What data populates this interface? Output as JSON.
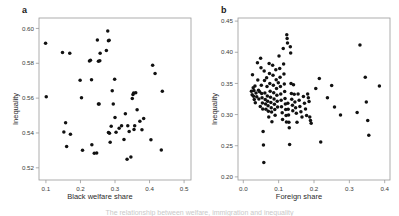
{
  "figure": {
    "background": "#ffffff",
    "marker_color": "#111111",
    "frame_color": "#9a9a9a",
    "caption": "The relationship between welfare, immigration and inequality"
  },
  "panels": [
    {
      "letter": "a",
      "chart_data": {
        "type": "scatter",
        "title": "",
        "xlabel": "Black welfare share",
        "ylabel": "Inequality",
        "xlim": [
          0.08,
          0.52
        ],
        "ylim": [
          0.513,
          0.606
        ],
        "xticks": [
          "0.1",
          "0.2",
          "0.3",
          "0.4",
          "0.5"
        ],
        "xtick_values": [
          0.1,
          0.2,
          0.3,
          0.4,
          0.5
        ],
        "yticks": [
          "0.52",
          "0.54",
          "0.56",
          "0.58",
          "0.60"
        ],
        "ytick_values": [
          0.52,
          0.54,
          0.56,
          0.58,
          0.6
        ],
        "grid": false,
        "legend": "none",
        "n_points": 59,
        "points": [
          [
            0.099,
            0.5915
          ],
          [
            0.101,
            0.5608
          ],
          [
            0.148,
            0.5862
          ],
          [
            0.152,
            0.5405
          ],
          [
            0.157,
            0.5459
          ],
          [
            0.16,
            0.5322
          ],
          [
            0.169,
            0.5858
          ],
          [
            0.171,
            0.5392
          ],
          [
            0.199,
            0.5703
          ],
          [
            0.203,
            0.5602
          ],
          [
            0.206,
            0.5301
          ],
          [
            0.226,
            0.5813
          ],
          [
            0.229,
            0.5818
          ],
          [
            0.232,
            0.5705
          ],
          [
            0.233,
            0.5332
          ],
          [
            0.24,
            0.5284
          ],
          [
            0.247,
            0.5285
          ],
          [
            0.249,
            0.5933
          ],
          [
            0.252,
            0.5812
          ],
          [
            0.252,
            0.5566
          ],
          [
            0.254,
            0.5566
          ],
          [
            0.256,
            0.5814
          ],
          [
            0.257,
            0.5858
          ],
          [
            0.275,
            0.5873
          ],
          [
            0.279,
            0.5985
          ],
          [
            0.281,
            0.593
          ],
          [
            0.281,
            0.5402
          ],
          [
            0.283,
            0.5932
          ],
          [
            0.284,
            0.5399
          ],
          [
            0.286,
            0.5346
          ],
          [
            0.289,
            0.5438
          ],
          [
            0.292,
            0.5643
          ],
          [
            0.295,
            0.5567
          ],
          [
            0.299,
            0.5709
          ],
          [
            0.3,
            0.5489
          ],
          [
            0.303,
            0.5404
          ],
          [
            0.312,
            0.5427
          ],
          [
            0.319,
            0.5441
          ],
          [
            0.326,
            0.5362
          ],
          [
            0.33,
            0.5511
          ],
          [
            0.335,
            0.5249
          ],
          [
            0.337,
            0.5441
          ],
          [
            0.341,
            0.5408
          ],
          [
            0.346,
            0.5262
          ],
          [
            0.35,
            0.5598
          ],
          [
            0.352,
            0.5621
          ],
          [
            0.354,
            0.5629
          ],
          [
            0.355,
            0.542
          ],
          [
            0.357,
            0.5442
          ],
          [
            0.36,
            0.5631
          ],
          [
            0.364,
            0.5534
          ],
          [
            0.372,
            0.5467
          ],
          [
            0.378,
            0.5418
          ],
          [
            0.383,
            0.5483
          ],
          [
            0.404,
            0.5361
          ],
          [
            0.409,
            0.5789
          ],
          [
            0.416,
            0.5742
          ],
          [
            0.434,
            0.5302
          ],
          [
            0.437,
            0.5639
          ]
        ]
      }
    },
    {
      "letter": "b",
      "chart_data": {
        "type": "scatter",
        "title": "",
        "xlabel": "Foreign share",
        "ylabel": "Inequality",
        "xlim": [
          -0.015,
          0.415
        ],
        "ylim": [
          0.195,
          0.455
        ],
        "xticks": [
          "0.0",
          "0.1",
          "0.2",
          "0.3",
          "0.4"
        ],
        "xtick_values": [
          0.0,
          0.1,
          0.2,
          0.3,
          0.4
        ],
        "yticks": [
          "0.20",
          "0.25",
          "0.30",
          "0.35",
          "0.40",
          "0.45"
        ],
        "ytick_values": [
          0.2,
          0.25,
          0.3,
          0.35,
          0.4,
          0.45
        ],
        "grid": false,
        "legend": "none",
        "n_points": 131,
        "points": [
          [
            0.023,
            0.3375
          ],
          [
            0.025,
            0.332
          ],
          [
            0.026,
            0.364
          ],
          [
            0.028,
            0.343
          ],
          [
            0.029,
            0.3295
          ],
          [
            0.03,
            0.3385
          ],
          [
            0.031,
            0.3242
          ],
          [
            0.033,
            0.346
          ],
          [
            0.034,
            0.319
          ],
          [
            0.036,
            0.3345
          ],
          [
            0.038,
            0.3288
          ],
          [
            0.04,
            0.383
          ],
          [
            0.041,
            0.3555
          ],
          [
            0.043,
            0.339
          ],
          [
            0.044,
            0.325
          ],
          [
            0.046,
            0.3365
          ],
          [
            0.048,
            0.313
          ],
          [
            0.049,
            0.3905
          ],
          [
            0.05,
            0.375
          ],
          [
            0.051,
            0.347
          ],
          [
            0.052,
            0.334
          ],
          [
            0.053,
            0.327
          ],
          [
            0.054,
            0.3185
          ],
          [
            0.055,
            0.309
          ],
          [
            0.056,
            0.273
          ],
          [
            0.057,
            0.251
          ],
          [
            0.058,
            0.223
          ],
          [
            0.059,
            0.37
          ],
          [
            0.06,
            0.3545
          ],
          [
            0.061,
            0.3345
          ],
          [
            0.062,
            0.324
          ],
          [
            0.063,
            0.317
          ],
          [
            0.064,
            0.3085
          ],
          [
            0.066,
            0.359
          ],
          [
            0.067,
            0.345
          ],
          [
            0.068,
            0.33
          ],
          [
            0.069,
            0.3215
          ],
          [
            0.07,
            0.314
          ],
          [
            0.071,
            0.3055
          ],
          [
            0.072,
            0.296
          ],
          [
            0.073,
            0.382
          ],
          [
            0.074,
            0.366
          ],
          [
            0.075,
            0.35
          ],
          [
            0.076,
            0.3375
          ],
          [
            0.077,
            0.328
          ],
          [
            0.078,
            0.3195
          ],
          [
            0.079,
            0.311
          ],
          [
            0.08,
            0.304
          ],
          [
            0.081,
            0.2885
          ],
          [
            0.083,
            0.379
          ],
          [
            0.084,
            0.363
          ],
          [
            0.085,
            0.347
          ],
          [
            0.086,
            0.335
          ],
          [
            0.087,
            0.325
          ],
          [
            0.088,
            0.3165
          ],
          [
            0.089,
            0.308
          ],
          [
            0.09,
            0.299
          ],
          [
            0.092,
            0.372
          ],
          [
            0.093,
            0.356
          ],
          [
            0.094,
            0.342
          ],
          [
            0.095,
            0.331
          ],
          [
            0.096,
            0.3215
          ],
          [
            0.097,
            0.312
          ],
          [
            0.099,
            0.351
          ],
          [
            0.101,
            0.394
          ],
          [
            0.103,
            0.374
          ],
          [
            0.104,
            0.36
          ],
          [
            0.105,
            0.345
          ],
          [
            0.106,
            0.333
          ],
          [
            0.107,
            0.323
          ],
          [
            0.108,
            0.3125
          ],
          [
            0.11,
            0.303
          ],
          [
            0.111,
            0.292
          ],
          [
            0.113,
            0.406
          ],
          [
            0.114,
            0.381
          ],
          [
            0.115,
            0.365
          ],
          [
            0.116,
            0.349
          ],
          [
            0.117,
            0.337
          ],
          [
            0.118,
            0.326
          ],
          [
            0.119,
            0.317
          ],
          [
            0.12,
            0.308
          ],
          [
            0.121,
            0.2985
          ],
          [
            0.122,
            0.288
          ],
          [
            0.123,
            0.428
          ],
          [
            0.124,
            0.422
          ],
          [
            0.125,
            0.415
          ],
          [
            0.126,
            0.318
          ],
          [
            0.127,
            0.3085
          ],
          [
            0.128,
            0.2995
          ],
          [
            0.129,
            0.2875
          ],
          [
            0.13,
            0.279
          ],
          [
            0.131,
            0.252
          ],
          [
            0.133,
            0.409
          ],
          [
            0.134,
            0.399
          ],
          [
            0.135,
            0.35
          ],
          [
            0.136,
            0.334
          ],
          [
            0.137,
            0.3245
          ],
          [
            0.139,
            0.315
          ],
          [
            0.14,
            0.306
          ],
          [
            0.142,
            0.348
          ],
          [
            0.144,
            0.3325
          ],
          [
            0.146,
            0.32
          ],
          [
            0.148,
            0.311
          ],
          [
            0.15,
            0.302
          ],
          [
            0.152,
            0.2875
          ],
          [
            0.155,
            0.333
          ],
          [
            0.158,
            0.323
          ],
          [
            0.16,
            0.313
          ],
          [
            0.163,
            0.3045
          ],
          [
            0.166,
            0.296
          ],
          [
            0.17,
            0.329
          ],
          [
            0.173,
            0.318
          ],
          [
            0.176,
            0.309
          ],
          [
            0.179,
            0.2985
          ],
          [
            0.182,
            0.333
          ],
          [
            0.184,
            0.327
          ],
          [
            0.186,
            0.321
          ],
          [
            0.188,
            0.296
          ],
          [
            0.19,
            0.2905
          ],
          [
            0.192,
            0.286
          ],
          [
            0.205,
            0.342
          ],
          [
            0.215,
            0.358
          ],
          [
            0.219,
            0.256
          ],
          [
            0.238,
            0.327
          ],
          [
            0.25,
            0.3465
          ],
          [
            0.258,
            0.312
          ],
          [
            0.275,
            0.2995
          ],
          [
            0.322,
            0.3035
          ],
          [
            0.33,
            0.4115
          ],
          [
            0.345,
            0.36
          ],
          [
            0.348,
            0.32
          ],
          [
            0.352,
            0.2905
          ],
          [
            0.355,
            0.267
          ],
          [
            0.385,
            0.346
          ]
        ]
      }
    }
  ]
}
